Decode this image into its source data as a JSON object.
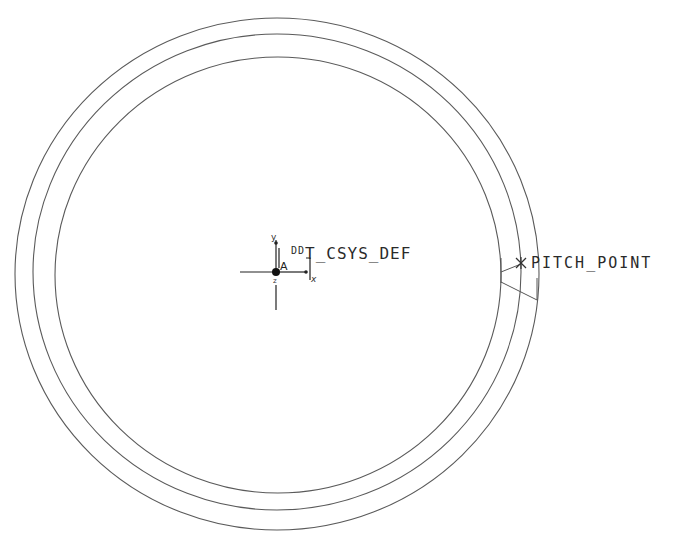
{
  "drawing": {
    "background": "#ffffff",
    "line_color": "#555555",
    "circles": [
      {
        "name": "outer-circle",
        "cx": 277,
        "cy": 274,
        "rx": 262,
        "ry": 256
      },
      {
        "name": "middle-circle",
        "cx": 277,
        "cy": 272,
        "rx": 244,
        "ry": 238
      },
      {
        "name": "inner-circle",
        "cx": 278,
        "cy": 275,
        "rx": 223,
        "ry": 218
      }
    ],
    "csys": {
      "label_prefix": "DD",
      "label": "T_CSYS_DEF",
      "origin": {
        "x": 276,
        "y": 272
      },
      "axis_x": "x",
      "axis_y": "y",
      "axis_z": "z",
      "marker": "A"
    },
    "pitch_point": {
      "label": "PITCH_POINT",
      "x": 521,
      "y": 263
    }
  }
}
